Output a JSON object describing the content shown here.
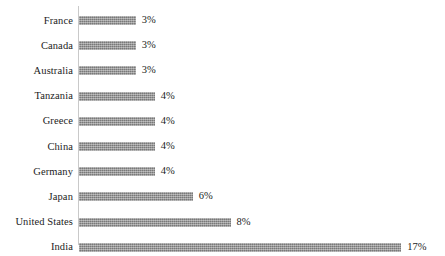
{
  "chart_data": {
    "type": "bar",
    "orientation": "horizontal",
    "title": "",
    "subtitle": "",
    "xlabel": "",
    "ylabel": "",
    "grid": false,
    "legend": null,
    "xlim": [
      0,
      17
    ],
    "value_suffix": "%",
    "categories": [
      "France",
      "Canada",
      "Australia",
      "Tanzania",
      "Greece",
      "China",
      "Germany",
      "Japan",
      "United States",
      "India"
    ],
    "values": [
      3,
      3,
      3,
      4,
      4,
      4,
      4,
      6,
      8,
      17
    ],
    "data_labels": [
      "3%",
      "3%",
      "3%",
      "4%",
      "4%",
      "4%",
      "4%",
      "6%",
      "8%",
      "17%"
    ],
    "bar_color": "#8a8a8a",
    "axis_color": "#c9c9c9",
    "background_color": "#ffffff"
  }
}
